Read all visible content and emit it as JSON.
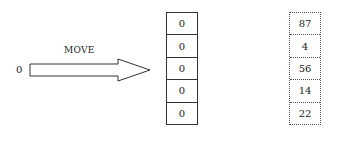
{
  "arrow": {
    "label": "MOVE",
    "source_value": "0"
  },
  "left_array": {
    "cells": [
      "0",
      "0",
      "0",
      "0",
      "0"
    ]
  },
  "right_array": {
    "cells": [
      "87",
      "4",
      "56",
      "14",
      "22"
    ]
  }
}
